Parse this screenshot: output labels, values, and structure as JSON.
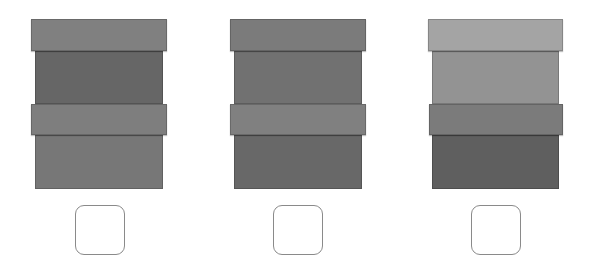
{
  "options": [
    {
      "id": "option-1",
      "segments": [
        {
          "type": "band",
          "x": 31,
          "y": 19,
          "w": 136,
          "h": 32,
          "color": "#808080"
        },
        {
          "type": "body",
          "x": 35,
          "y": 51,
          "w": 128,
          "h": 53,
          "color": "#666666"
        },
        {
          "type": "band",
          "x": 31,
          "y": 104,
          "w": 136,
          "h": 31,
          "color": "#7e7e7e"
        },
        {
          "type": "body",
          "x": 35,
          "y": 135,
          "w": 128,
          "h": 54,
          "color": "#777777"
        }
      ],
      "checkbox": {
        "x": 75,
        "y": 205,
        "checked": false
      }
    },
    {
      "id": "option-2",
      "segments": [
        {
          "type": "band",
          "x": 230,
          "y": 19,
          "w": 136,
          "h": 32,
          "color": "#7b7b7b"
        },
        {
          "type": "body",
          "x": 234,
          "y": 51,
          "w": 128,
          "h": 53,
          "color": "#717171"
        },
        {
          "type": "band",
          "x": 230,
          "y": 104,
          "w": 136,
          "h": 31,
          "color": "#808080"
        },
        {
          "type": "body",
          "x": 234,
          "y": 135,
          "w": 128,
          "h": 54,
          "color": "#686868"
        }
      ],
      "checkbox": {
        "x": 273,
        "y": 205,
        "checked": false
      }
    },
    {
      "id": "option-3",
      "segments": [
        {
          "type": "band",
          "x": 428,
          "y": 19,
          "w": 135,
          "h": 32,
          "color": "#a4a4a4"
        },
        {
          "type": "body",
          "x": 432,
          "y": 51,
          "w": 127,
          "h": 53,
          "color": "#939393"
        },
        {
          "type": "band",
          "x": 429,
          "y": 104,
          "w": 134,
          "h": 31,
          "color": "#7b7b7b"
        },
        {
          "type": "body",
          "x": 432,
          "y": 135,
          "w": 127,
          "h": 54,
          "color": "#5f5f5f"
        }
      ],
      "checkbox": {
        "x": 471,
        "y": 205,
        "checked": false
      }
    }
  ]
}
